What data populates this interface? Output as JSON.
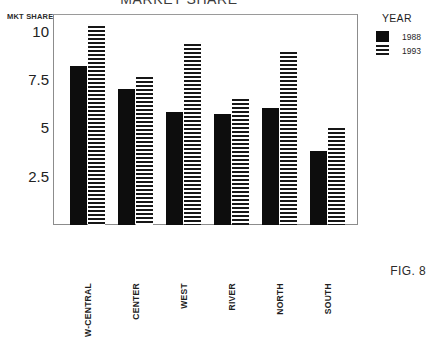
{
  "figure": {
    "caption": "FIG. 8"
  },
  "axis": {
    "y_caption": "MKT SHARE",
    "ticks": [
      "10",
      "7.5",
      "5",
      "2.5"
    ]
  },
  "legend": {
    "title": "YEAR",
    "entries": [
      {
        "label": "1988",
        "swatch": "solid-black-swatch",
        "color": "#0d0d0d"
      },
      {
        "label": "1993",
        "swatch": "horizontal-stripe-swatch",
        "color": "#171717"
      }
    ]
  },
  "chart_data": {
    "type": "bar",
    "title": "MARKET SHARE",
    "xlabel": "",
    "ylabel": "MKT SHARE",
    "ylim": [
      0,
      10.6
    ],
    "yticks": [
      2.5,
      5,
      7.5,
      10
    ],
    "grid": false,
    "legend_position": "right",
    "categories": [
      "W-CENTRAL",
      "CENTER",
      "WEST",
      "RIVER",
      "NORTH",
      "SOUTH"
    ],
    "series": [
      {
        "name": "1988",
        "values": [
          8.0,
          6.85,
          5.7,
          5.6,
          5.9,
          3.7
        ]
      },
      {
        "name": "1993",
        "values": [
          10.0,
          7.45,
          9.1,
          6.35,
          8.7,
          4.9
        ]
      }
    ]
  }
}
